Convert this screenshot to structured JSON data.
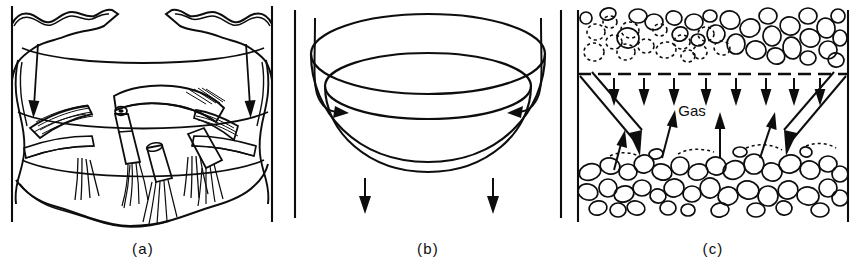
{
  "figure": {
    "title": "",
    "background_color": "#ffffff",
    "ink_color": "#0d0d0d",
    "style": "black-and-white line drawing",
    "panel_count": 3
  },
  "panels": [
    {
      "id": "a",
      "caption": "(a)",
      "label": "(a)",
      "description": "Spouted bed with irregular jagged bed surface, internal draft tube nozzles and streaming particle trails, two inward-pointing solid arrows from the vessel walls",
      "arrow_count": 2,
      "arrow_direction": "inward-down",
      "wall_left_x": 12,
      "wall_right_x": 272
    },
    {
      "id": "b",
      "caption": "(b)",
      "label": "(b)",
      "description": "Open dish or bowl shaped bed viewed in perspective, two curved arrows flowing down the vessel walls into the bowl and two straight arrows leaving below",
      "arrow_count": 4,
      "curved_arrows": 2,
      "straight_arrows": 2,
      "wall_left_x": 10,
      "wall_right_x": 275
    },
    {
      "id": "c",
      "caption": "(c)",
      "label": "(c)",
      "gas_label": "Gas",
      "description": "Two particle beds separated by a gas gap; upper dilute bed with dashed and solid particle outlines above a dashed distributor line, lower dense packed bed; eight short downward arrows, four upward gas arrows, two long open double-line downward arrows from the walls",
      "down_arrow_count": 8,
      "up_arrow_count": 4,
      "open_arrow_count": 2,
      "wall_left_x": 8,
      "wall_right_x": 278
    }
  ],
  "labels": {
    "caption_a": "(a)",
    "caption_b": "(b)",
    "caption_c": "(c)",
    "gas": "Gas"
  },
  "colors": {
    "ink": "#0d0d0d",
    "background": "#ffffff"
  }
}
